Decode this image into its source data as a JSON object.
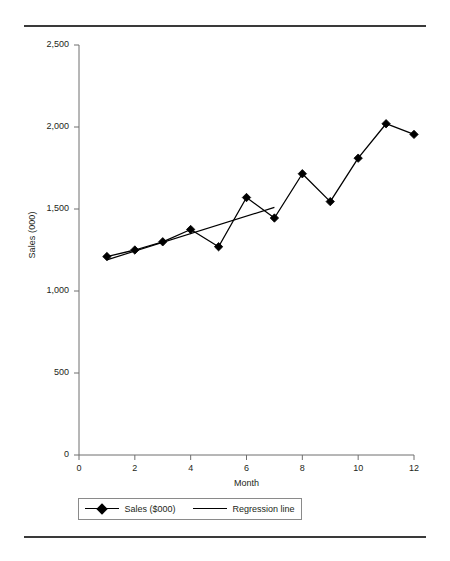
{
  "chart_data": {
    "type": "line",
    "title": "",
    "xlabel": "Month",
    "ylabel": "Sales (000)",
    "xlim": [
      0,
      12
    ],
    "ylim": [
      0,
      2500
    ],
    "grid": false,
    "legend_position": "bottom",
    "x_ticks": [
      "0",
      "2",
      "4",
      "6",
      "8",
      "10",
      "12"
    ],
    "x_tick_values": [
      0,
      2,
      4,
      6,
      8,
      10,
      12
    ],
    "y_ticks": [
      "0",
      "500",
      "1,000",
      "1,500",
      "2,000",
      "2,500"
    ],
    "y_tick_values": [
      0,
      500,
      1000,
      1500,
      2000,
      2500
    ],
    "x": [
      1,
      2,
      3,
      4,
      5,
      6,
      7,
      8,
      9,
      10,
      11,
      12
    ],
    "series": [
      {
        "name": "Sales ($000)",
        "type": "line-marker",
        "marker": "diamond",
        "color": "#000000",
        "values": [
          1210,
          1250,
          1300,
          1375,
          1270,
          1570,
          1445,
          1715,
          1545,
          1810,
          2020,
          1955
        ]
      },
      {
        "name": "Regression line",
        "type": "line",
        "marker": "none",
        "color": "#000000",
        "endpoints_x": [
          1,
          7
        ],
        "endpoints_y": [
          1190,
          1510
        ]
      }
    ],
    "legend": [
      {
        "label": "Sales ($000)",
        "marker": "diamond"
      },
      {
        "label": "Regression line",
        "marker": "none"
      }
    ]
  },
  "axes": {
    "y_label": "Sales (000)",
    "x_label": "Month"
  },
  "legend": {
    "items": [
      {
        "label": "Sales ($000)"
      },
      {
        "label": "Regression line"
      }
    ]
  },
  "colors": {
    "data": "#000000",
    "axis": "#6f6f6f",
    "rule": "#3a3a3a",
    "text": "#231f20"
  }
}
